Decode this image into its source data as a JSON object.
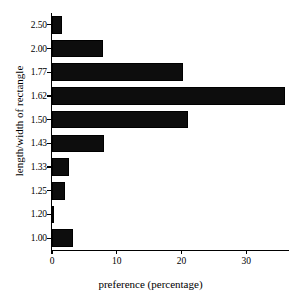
{
  "chart_data": {
    "type": "bar",
    "orientation": "horizontal",
    "title": "",
    "xlabel": "preference (percentage)",
    "ylabel": "length/width of rectangle",
    "categories": [
      "2.50",
      "2.00",
      "1.77",
      "1.62",
      "1.50",
      "1.43",
      "1.33",
      "1.25",
      "1.20",
      "1.00"
    ],
    "values": [
      1.5,
      7.8,
      20.3,
      36.0,
      21.0,
      8.0,
      2.6,
      2.0,
      0.3,
      3.2
    ],
    "xlim": [
      0,
      36.6
    ],
    "xticks": [
      0,
      10,
      20,
      30
    ],
    "xtick_labels": [
      "0",
      "10",
      "20",
      "30"
    ],
    "grid": false,
    "legend": false,
    "bar_color": "#0d0d0d",
    "axis_color": "#000000",
    "background": "#ffffff"
  }
}
